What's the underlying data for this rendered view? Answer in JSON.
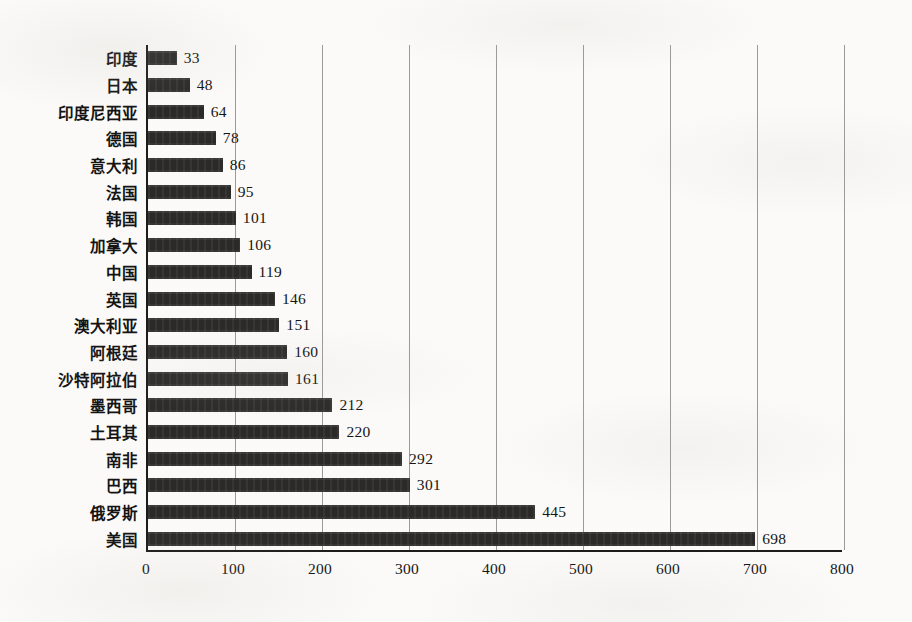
{
  "chart_data": {
    "type": "bar",
    "orientation": "horizontal",
    "title": "",
    "subtitle": "",
    "xlabel": "",
    "ylabel": "",
    "xlim": [
      0,
      800
    ],
    "xticks": [
      "0",
      "100",
      "200",
      "300",
      "400",
      "500",
      "600",
      "700",
      "800"
    ],
    "grid": true,
    "legend": false,
    "bar_color": "#2b2a29",
    "axis_color": "#1c1c1c",
    "gridline_color": "#9a9a98",
    "background_color": "#fbfaf8",
    "categories": [
      "印度",
      "日本",
      "印度尼西亚",
      "德国",
      "意大利",
      "法国",
      "韩国",
      "加拿大",
      "中国",
      "英国",
      "澳大利亚",
      "阿根廷",
      "沙特阿拉伯",
      "墨西哥",
      "土耳其",
      "南非",
      "巴西",
      "俄罗斯",
      "美国"
    ],
    "values": [
      33,
      48,
      64,
      78,
      86,
      95,
      101,
      106,
      119,
      146,
      151,
      160,
      161,
      212,
      220,
      292,
      301,
      445,
      698
    ],
    "data_labels": [
      "33",
      "48",
      "64",
      "78",
      "86",
      "95",
      "101",
      "106",
      "119",
      "146",
      "151",
      "160",
      "161",
      "212",
      "220",
      "292",
      "301",
      "445",
      "698"
    ]
  }
}
